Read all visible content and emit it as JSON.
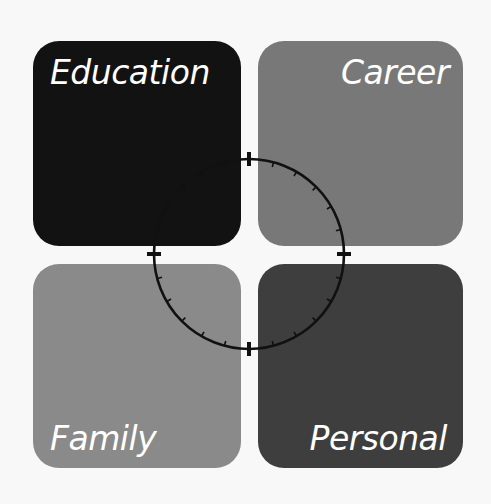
{
  "diagram": {
    "quadrants": [
      {
        "id": "education",
        "label": "Education",
        "color": "#121212",
        "position": "top-left"
      },
      {
        "id": "career",
        "label": "Career",
        "color": "#787878",
        "position": "top-right"
      },
      {
        "id": "family",
        "label": "Family",
        "color": "#8a8a8a",
        "position": "bottom-left"
      },
      {
        "id": "personal",
        "label": "Personal",
        "color": "#3e3e3e",
        "position": "bottom-right"
      }
    ],
    "dial": {
      "center": [
        249,
        254
      ],
      "radius": 95,
      "stroke_color": "#111111",
      "major_markers": 4,
      "minor_ticks_per_quadrant": 5
    },
    "background_color": "#f8f8f8"
  }
}
